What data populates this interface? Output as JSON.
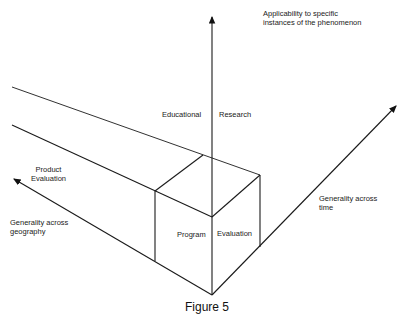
{
  "figure": {
    "caption": "Figure 5",
    "axes": {
      "vertical": {
        "label_line1": "Applicability to specific",
        "label_line2": "instances of the phenomenon"
      },
      "right": {
        "label_line1": "Generality across",
        "label_line2": "time"
      },
      "left": {
        "label_line1": "Generality across",
        "label_line2": "geography"
      }
    },
    "regions": {
      "upper_left": "Educational",
      "upper_right": "Research",
      "band": {
        "line1": "Product",
        "line2": "Evaluation"
      },
      "cube_left": "Program",
      "cube_right": "Evaluation"
    }
  }
}
